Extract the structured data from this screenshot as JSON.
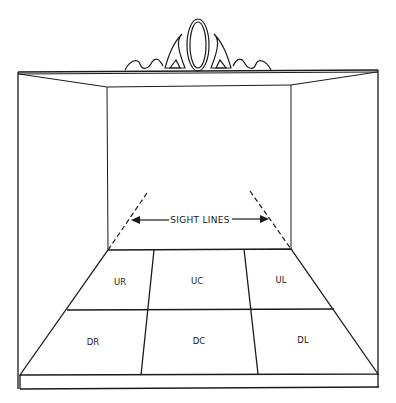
{
  "diagram": {
    "type": "stage-areas",
    "sight_lines_label": "SIGHT LINES",
    "areas": [
      {
        "label": "UR",
        "row": "upstage",
        "col": "right"
      },
      {
        "label": "UC",
        "row": "upstage",
        "col": "center"
      },
      {
        "label": "UL",
        "row": "upstage",
        "col": "left"
      },
      {
        "label": "DR",
        "row": "downstage",
        "col": "right"
      },
      {
        "label": "DC",
        "row": "downstage",
        "col": "center"
      },
      {
        "label": "DL",
        "row": "downstage",
        "col": "left"
      }
    ],
    "colors": {
      "line": "#1a1a1a",
      "background": "#ffffff"
    }
  }
}
